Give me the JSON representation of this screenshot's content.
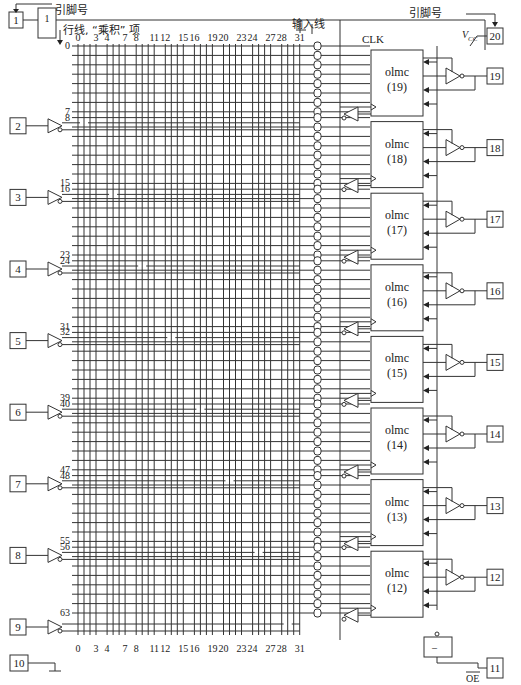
{
  "annotations": {
    "pin_number_left": "引脚号",
    "pin_number_right": "引脚号",
    "row_line": "行线, “乘积” 项",
    "input_line": "输入线",
    "clk": "CLK",
    "vcc": "V",
    "vcc_sub": "CC",
    "oe": "OE",
    "oe_gate": "–"
  },
  "column_labels": [
    "0",
    "3",
    "4",
    "7",
    "8",
    "11",
    "12",
    "15",
    "16",
    "19",
    "20",
    "23",
    "24",
    "27",
    "28",
    "31"
  ],
  "input_pins": [
    {
      "pin": "1",
      "type": "clk"
    },
    {
      "pin": "2"
    },
    {
      "pin": "3"
    },
    {
      "pin": "4"
    },
    {
      "pin": "5"
    },
    {
      "pin": "6"
    },
    {
      "pin": "7"
    },
    {
      "pin": "8"
    },
    {
      "pin": "9"
    }
  ],
  "ground_pin": "10",
  "vcc_pin": "20",
  "oe_pin": "11",
  "olmc_blocks": [
    {
      "name": "olmc",
      "id": "(19)",
      "pin": "19",
      "rows": [
        "0",
        "7"
      ]
    },
    {
      "name": "olmc",
      "id": "(18)",
      "pin": "18",
      "rows": [
        "8",
        "15"
      ]
    },
    {
      "name": "olmc",
      "id": "(17)",
      "pin": "17",
      "rows": [
        "16",
        "23"
      ]
    },
    {
      "name": "olmc",
      "id": "(16)",
      "pin": "16",
      "rows": [
        "24",
        "31"
      ]
    },
    {
      "name": "olmc",
      "id": "(15)",
      "pin": "15",
      "rows": [
        "32",
        "39"
      ]
    },
    {
      "name": "olmc",
      "id": "(14)",
      "pin": "14",
      "rows": [
        "40",
        "47"
      ]
    },
    {
      "name": "olmc",
      "id": "(13)",
      "pin": "13",
      "rows": [
        "48",
        "55"
      ]
    },
    {
      "name": "olmc",
      "id": "(12)",
      "pin": "12",
      "rows": [
        "56",
        "63"
      ]
    }
  ]
}
